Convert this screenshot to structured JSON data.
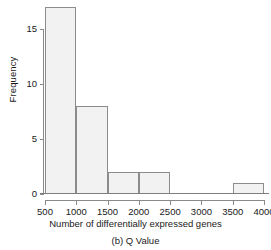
{
  "chart_data": {
    "type": "bar",
    "title": "",
    "subtitle": "",
    "caption": "(b) Q Value",
    "xlabel": "Number of differentially expressed genes",
    "ylabel": "Frequency",
    "bin_width": 500,
    "categories": [
      "500-1000",
      "1000-1500",
      "1500-2000",
      "2000-2500",
      "2500-3000",
      "3000-3500",
      "3500-4000"
    ],
    "bin_edges": [
      500,
      1000,
      1500,
      2000,
      2500,
      3000,
      3500,
      4000
    ],
    "values": [
      17,
      8,
      2,
      2,
      0,
      0,
      1
    ],
    "bars": [
      {
        "x0": 500,
        "x1": 1000,
        "value": 17
      },
      {
        "x0": 1000,
        "x1": 1500,
        "value": 8
      },
      {
        "x0": 1500,
        "x1": 2000,
        "value": 2
      },
      {
        "x0": 2000,
        "x1": 2500,
        "value": 2
      },
      {
        "x0": 2500,
        "x1": 3000,
        "value": 0
      },
      {
        "x0": 3000,
        "x1": 3500,
        "value": 0
      },
      {
        "x0": 3500,
        "x1": 4000,
        "value": 1
      }
    ],
    "xlim": [
      500,
      4000
    ],
    "ylim": [
      0,
      17.6
    ],
    "xticks": [
      500,
      1000,
      1500,
      2000,
      2500,
      3000,
      3500,
      4000
    ],
    "xtick_labels": [
      "500",
      "1000",
      "1500",
      "2000",
      "2500",
      "3000",
      "3500",
      "4000"
    ],
    "yticks": [
      0,
      5,
      10,
      15
    ],
    "ytick_labels": [
      "0",
      "5",
      "10",
      "15"
    ],
    "grid": false,
    "legend": null,
    "colors": {
      "bar_fill": "#f2f2f2",
      "bar_edge": "#8c8c8c",
      "axis": "#8a8a8a",
      "text": "#1a1a1a",
      "background": "#ffffff"
    }
  }
}
